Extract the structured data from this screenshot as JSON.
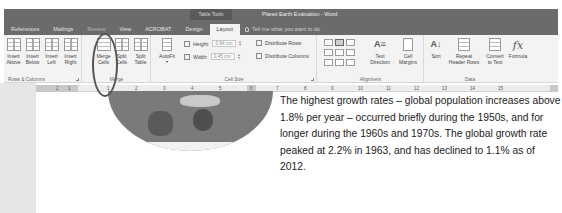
{
  "window": {
    "context_tab_group": "Table Tools",
    "title": "Planet Earth Evaluation - Word"
  },
  "tabs": [
    {
      "label": "References",
      "active": false
    },
    {
      "label": "Mailings",
      "active": false
    },
    {
      "label": "Review",
      "active": false
    },
    {
      "label": "View",
      "active": false
    },
    {
      "label": "ACROBAT",
      "active": false
    },
    {
      "label": "Design",
      "active": false
    },
    {
      "label": "Layout",
      "active": true
    }
  ],
  "tell_me": {
    "placeholder": "Tell me what you want to do"
  },
  "ribbon": {
    "rows_columns": {
      "label": "Rows & Columns",
      "buttons": [
        {
          "line1": "Insert",
          "line2": "Above"
        },
        {
          "line1": "Insert",
          "line2": "Below"
        },
        {
          "line1": "Insert",
          "line2": "Left"
        },
        {
          "line1": "Insert",
          "line2": "Right"
        }
      ]
    },
    "merge": {
      "label": "Merge",
      "buttons": [
        {
          "line1": "Merge",
          "line2": "Cells"
        },
        {
          "line1": "Split",
          "line2": "Cells"
        },
        {
          "line1": "Split",
          "line2": "Table"
        }
      ]
    },
    "cell_size": {
      "label": "Cell Size",
      "autofit": {
        "line1": "AutoFit",
        "line2": "▾"
      },
      "height_label": "Height:",
      "height_value": "0.64 cm",
      "width_label": "Width:",
      "width_value": "0.45 cm",
      "distribute_rows": "Distribute Rows",
      "distribute_columns": "Distribute Columns"
    },
    "alignment": {
      "label": "Alignment",
      "text_direction": {
        "line1": "Text",
        "line2": "Direction"
      },
      "cell_margins": {
        "line1": "Cell",
        "line2": "Margins"
      }
    },
    "data": {
      "label": "Data",
      "sort": "Sort",
      "repeat_header": {
        "line1": "Repeat",
        "line2": "Header Rows"
      },
      "convert": {
        "line1": "Convert",
        "line2": "to Text"
      },
      "formula": "Formula"
    }
  },
  "ruler": {
    "numbers": [
      "2",
      "1",
      "1",
      "2",
      "3",
      "4",
      "5",
      "6",
      "7",
      "8",
      "9",
      "10",
      "11",
      "12",
      "13",
      "14",
      "15"
    ]
  },
  "document": {
    "paragraph1": "The highest growth rates – global population increases above 1.8% per year – occurred briefly during the 1950s, and for longer during the 1960s and 1970s. The global growth rate peaked at 2.2% in 1963, and has declined to 1.1% as of 2012.",
    "paragraph2": "Total annual births were highest in the late 1980s at about 139 million, and are now expected to remain essentially constant at their 2011 level of 135 million, while deaths number 56 million per"
  }
}
